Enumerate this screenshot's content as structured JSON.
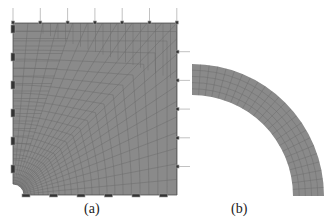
{
  "figure": {
    "panels": [
      {
        "id": "a",
        "label": "(a)",
        "description": "Square plate finite-element mesh with quarter-circle hole at bottom-left corner, refined near hole; boundary constraint symbols on left and bottom edges, load arrows on top and right edges"
      },
      {
        "id": "b",
        "label": "(b)",
        "description": "Quarter annulus (ring) finite-element mesh"
      }
    ],
    "colors": {
      "mesh_fill": "#8a8a8a",
      "mesh_lines": "#6a6a6a",
      "boundary_marks": "#3a3a3a",
      "background": "#ffffff"
    }
  }
}
